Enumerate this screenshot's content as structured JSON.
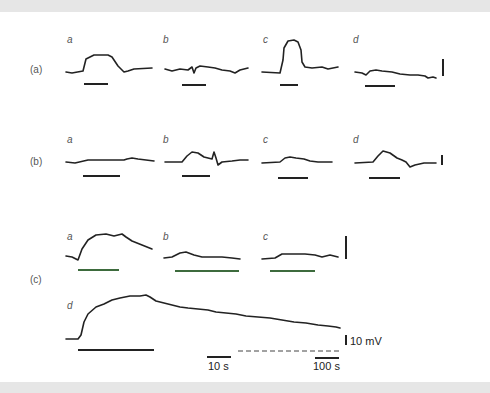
{
  "figure": {
    "rows": [
      {
        "label": "(a)",
        "panels": [
          "a",
          "b",
          "c",
          "d"
        ]
      },
      {
        "label": "(b)",
        "panels": [
          "a",
          "b",
          "c",
          "d"
        ]
      },
      {
        "label": "(c)",
        "panels": [
          "a",
          "b",
          "c",
          "d"
        ]
      }
    ],
    "scale_bars": {
      "voltage": "10 mV",
      "time_short": "10 s",
      "time_long": "100 s"
    },
    "colors": {
      "trace": "#222222",
      "stimulus_bar": "#222222",
      "stimulus_bar_green": "#3d6b3d",
      "label": "#555555"
    }
  },
  "caption": {
    "text": "Extracellular recordings of the response to stimuli at different concentrations"
  }
}
